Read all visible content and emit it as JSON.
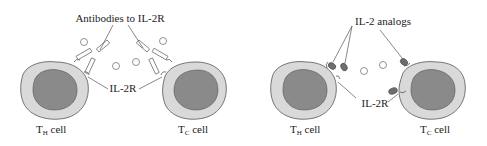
{
  "panels": [
    {
      "id": "left",
      "title_label": "Antibodies to IL-2R",
      "receptor_label": "IL-2R",
      "cells": [
        {
          "label_main": "T",
          "label_sub": "H",
          "label_rest": " cell"
        },
        {
          "label_main": "T",
          "label_sub": "C",
          "label_rest": " cell"
        }
      ]
    },
    {
      "id": "right",
      "title_label": "IL-2 analogs",
      "receptor_label": "IL-2R",
      "cells": [
        {
          "label_main": "T",
          "label_sub": "H",
          "label_rest": " cell"
        },
        {
          "label_main": "T",
          "label_sub": "C",
          "label_rest": " cell"
        }
      ]
    }
  ],
  "colors": {
    "cytoplasm": "#d9d9d9",
    "nucleus": "#8a8a8a",
    "outline": "#555555",
    "analog": "#6e6e6e",
    "text": "#222222"
  }
}
